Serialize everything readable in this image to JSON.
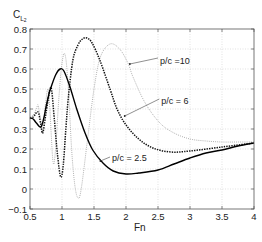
{
  "chart_data": {
    "type": "line",
    "title": "",
    "xlabel": "Fn",
    "ylabel": "C_L2",
    "ylabel_main": "C",
    "ylabel_sub": "L",
    "ylabel_subsub": "2",
    "xlim": [
      0.5,
      4
    ],
    "ylim": [
      -0.1,
      0.8
    ],
    "grid": true,
    "legend_position": "inline annotations",
    "x_ticks": [
      0.5,
      1,
      1.5,
      2,
      2.5,
      3,
      3.5,
      4
    ],
    "x_tick_labels": [
      "0.5",
      "1",
      "1.5",
      "2",
      "2.5",
      "3",
      "3.5",
      "4"
    ],
    "y_ticks": [
      -0.1,
      0,
      0.1,
      0.2,
      0.3,
      0.4,
      0.5,
      0.6,
      0.7,
      0.8
    ],
    "y_tick_labels": [
      "−0.1",
      "0",
      "0.1",
      "0.2",
      "0.3",
      "0.4",
      "0.5",
      "0.6",
      "0.7",
      "0.8"
    ],
    "series": [
      {
        "name": "p/c = 10",
        "style": "dotted",
        "color": "#a8a8a8",
        "width": 0.9,
        "dash": "1 1.1",
        "x": [
          0.5,
          0.55,
          0.6,
          0.625,
          0.66,
          0.7,
          0.74,
          0.78,
          0.81,
          0.86,
          0.9,
          0.95,
          1.0,
          1.05,
          1.1,
          1.15,
          1.2,
          1.25,
          1.3,
          1.4,
          1.5,
          1.6,
          1.75,
          1.9,
          2.03,
          2.11,
          2.3,
          2.53,
          2.75,
          3.0,
          3.25,
          3.5,
          3.75,
          4.0
        ],
        "y": [
          0.36,
          0.37,
          0.4,
          0.42,
          0.36,
          0.31,
          0.42,
          0.5,
          0.4,
          0.135,
          0.2,
          0.45,
          0.63,
          0.67,
          0.5,
          0.2,
          0.02,
          -0.045,
          0.0,
          0.25,
          0.5,
          0.66,
          0.725,
          0.7,
          0.63,
          0.56,
          0.43,
          0.33,
          0.28,
          0.25,
          0.24,
          0.235,
          0.235,
          0.235
        ]
      },
      {
        "name": "p/c = 6",
        "style": "dashed",
        "color": "#111111",
        "width": 1.5,
        "dash": "1.4 1.1",
        "x": [
          0.5,
          0.55,
          0.625,
          0.67,
          0.7,
          0.75,
          0.81,
          0.84,
          0.88,
          0.93,
          0.98,
          1.02,
          1.06,
          1.1,
          1.17,
          1.25,
          1.32,
          1.39,
          1.47,
          1.59,
          1.75,
          1.86,
          2.0,
          2.2,
          2.42,
          2.7,
          3.0,
          3.5,
          4.0
        ],
        "y": [
          0.355,
          0.36,
          0.385,
          0.32,
          0.28,
          0.38,
          0.495,
          0.49,
          0.35,
          0.17,
          0.06,
          0.12,
          0.3,
          0.46,
          0.645,
          0.72,
          0.75,
          0.755,
          0.73,
          0.645,
          0.5,
          0.4,
          0.32,
          0.25,
          0.205,
          0.185,
          0.19,
          0.21,
          0.23
        ]
      },
      {
        "name": "p/c = 2.5",
        "style": "solid",
        "color": "#000000",
        "width": 1.4,
        "dash": "",
        "x": [
          0.5,
          0.55,
          0.6,
          0.67,
          0.72,
          0.75,
          0.8,
          0.83,
          0.9,
          0.97,
          1.03,
          1.125,
          1.23,
          1.36,
          1.48,
          1.64,
          1.8,
          2.0,
          2.2,
          2.5,
          2.75,
          3.0,
          3.25,
          3.5,
          3.75,
          4.0
        ],
        "y": [
          0.355,
          0.35,
          0.33,
          0.31,
          0.36,
          0.41,
          0.48,
          0.51,
          0.57,
          0.6,
          0.59,
          0.51,
          0.4,
          0.28,
          0.195,
          0.13,
          0.09,
          0.075,
          0.08,
          0.095,
          0.125,
          0.155,
          0.18,
          0.195,
          0.215,
          0.23
        ]
      }
    ],
    "annotations": [
      {
        "text": "p/c =10",
        "text_fn": 2.53,
        "text_c": 0.64,
        "from_fn": 2.5,
        "from_c": 0.655,
        "to_fn": 2.06,
        "to_c": 0.625
      },
      {
        "text": "p/c = 6",
        "text_fn": 2.55,
        "text_c": 0.44,
        "from_fn": 2.52,
        "from_c": 0.45,
        "to_fn": 1.98,
        "to_c": 0.365
      },
      {
        "text": "p/c = 2.5",
        "text_fn": 1.78,
        "text_c": 0.155,
        "from_fn": 1.75,
        "from_c": 0.16,
        "to_fn": 1.6,
        "to_c": 0.14
      }
    ]
  },
  "colors": {
    "axis": "#555555",
    "grid": "#cfcfcf",
    "text": "#222222"
  }
}
